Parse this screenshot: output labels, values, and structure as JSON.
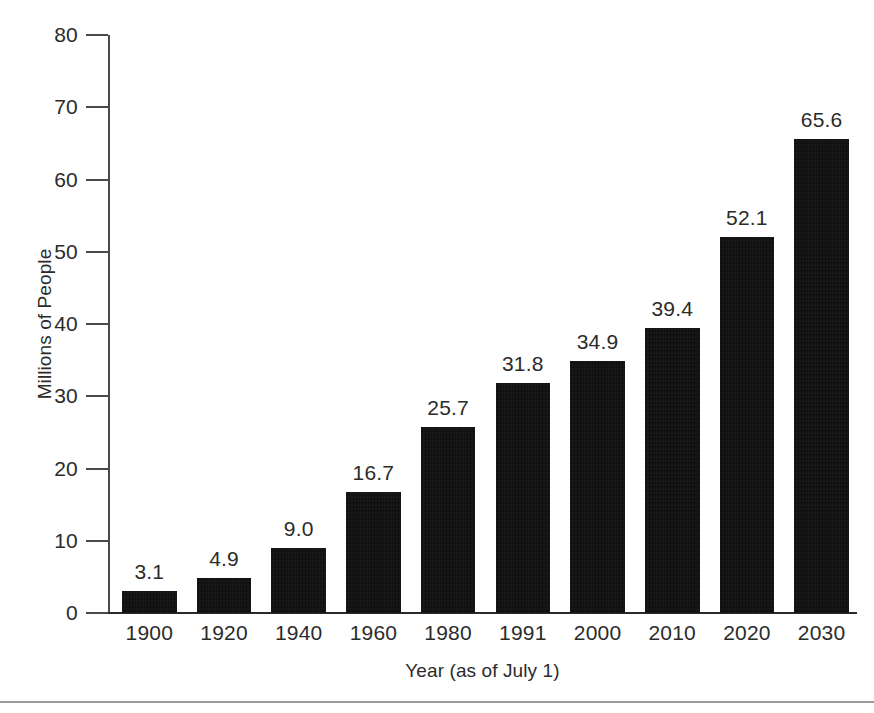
{
  "chart_data": {
    "type": "bar",
    "title": "",
    "subtitle": "",
    "xlabel": "Year (as of July 1)",
    "ylabel": "Millions of People",
    "categories": [
      "1900",
      "1920",
      "1940",
      "1960",
      "1980",
      "1991",
      "2000",
      "2010",
      "2020",
      "2030"
    ],
    "values": [
      3.1,
      4.9,
      9.0,
      16.7,
      25.7,
      31.8,
      34.9,
      39.4,
      52.1,
      65.6
    ],
    "value_labels": [
      "3.1",
      "4.9",
      "9.0",
      "16.7",
      "25.7",
      "31.8",
      "34.9",
      "39.4",
      "52.1",
      "65.6"
    ],
    "ylim": [
      0,
      80
    ],
    "y_ticks": [
      0,
      10,
      20,
      30,
      40,
      50,
      60,
      70,
      80
    ],
    "y_tick_labels": [
      "0",
      "10",
      "20",
      "30",
      "40",
      "50",
      "60",
      "70",
      "80"
    ],
    "grid": false,
    "legend": null,
    "legend_position": "none",
    "bar_color": "#0e0e0e",
    "axis_color": "#2b2b2b",
    "background_color": "#ffffff",
    "data_labels_shown": true
  },
  "axes": {
    "y_title": "Millions of People",
    "x_title": "Year (as of July 1)"
  }
}
